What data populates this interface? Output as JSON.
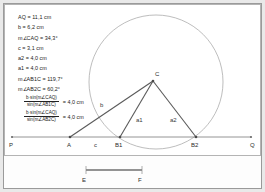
{
  "app": {
    "title": "Geometry Construction",
    "background_color": "#e9e9e9",
    "canvas_color": "#ffffff",
    "line_color": "#555555",
    "circle_color": "#9a9a9a",
    "text_color": "#1a1a1a"
  },
  "algebra": {
    "lines": [
      "AQ = 11,1 cm",
      "b = 6,2 cm",
      "m∠CAQ = 34,3°",
      "c = 3,1 cm",
      "a2 = 4,0 cm",
      "a1 = 4,0 cm",
      "m∠AB1C = 119,7°",
      "m∠AB2C = 60,2°"
    ],
    "fractions": [
      {
        "numerator": "b·sin(m∠CAQ)",
        "denominator": "sin(m∠AB1C)",
        "result": "= 4,0 cm"
      },
      {
        "numerator": "b·sin(m∠CAQ)",
        "denominator": "sin(m∠AB2C)",
        "result": "= 4,0 cm"
      }
    ]
  },
  "figure": {
    "points": [
      {
        "name": "P",
        "label": "P",
        "x": 11,
        "y": 143
      },
      {
        "name": "A",
        "label": "A",
        "x": 69,
        "y": 143
      },
      {
        "name": "B1",
        "label": "B1",
        "x": 119,
        "y": 143
      },
      {
        "name": "B2",
        "label": "B2",
        "x": 195,
        "y": 143
      },
      {
        "name": "Q",
        "label": "Q",
        "x": 250,
        "y": 143
      },
      {
        "name": "C",
        "label": "C",
        "x": 152,
        "y": 79
      }
    ],
    "segment_labels": [
      {
        "name": "side-b",
        "label": "b",
        "x": 101,
        "y": 110
      },
      {
        "name": "side-c",
        "label": "c",
        "x": 95,
        "y": 143
      },
      {
        "name": "side-a1",
        "label": "a1",
        "x": 139,
        "y": 125
      },
      {
        "name": "side-a2",
        "label": "a2",
        "x": 172,
        "y": 125
      }
    ],
    "circle": {
      "cx": 155,
      "cy": 81,
      "r": 67
    },
    "baseline": {
      "x1": 11,
      "y1": 136,
      "x2": 250,
      "y2": 136
    }
  },
  "strip": {
    "segment_label_left": "E",
    "segment_label_right": "F",
    "x1": 84,
    "x2": 140
  }
}
